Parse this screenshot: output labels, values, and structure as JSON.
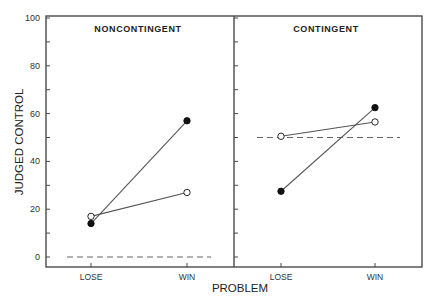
{
  "chart_data": {
    "type": "line",
    "ylabel": "JUDGED CONTROL",
    "xlabel": "PROBLEM",
    "ylim": [
      0,
      100
    ],
    "yticks": [
      0,
      20,
      40,
      60,
      80,
      100
    ],
    "yminor_step": 10,
    "grid": false,
    "legend": null,
    "categories": [
      "LOSE",
      "WIN"
    ],
    "panels": [
      {
        "title": "NONCONTINGENT",
        "reference_line": {
          "y": 0,
          "style": "dashed"
        },
        "series": [
          {
            "name": "filled",
            "marker": "filled-circle",
            "values": [
              14,
              57
            ]
          },
          {
            "name": "open",
            "marker": "open-circle",
            "values": [
              17,
              27
            ]
          }
        ]
      },
      {
        "title": "CONTINGENT",
        "reference_line": {
          "y": 50,
          "style": "dashed"
        },
        "series": [
          {
            "name": "filled",
            "marker": "filled-circle",
            "values": [
              27.5,
              62.5
            ]
          },
          {
            "name": "open",
            "marker": "open-circle",
            "values": [
              50.5,
              56.5
            ]
          }
        ]
      }
    ]
  },
  "colors": {
    "axis": "#4a4a4a",
    "line": "#555555",
    "marker": "#111111",
    "dash": "#666666"
  }
}
